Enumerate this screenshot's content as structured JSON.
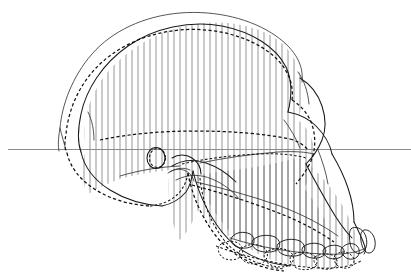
{
  "figure": {
    "background_color": "#ffffff",
    "width": 411,
    "height": 278,
    "view": "lateral (left side), anterior to the right"
  },
  "legend_semantics": {
    "solid_outline_label": "Solid outline skull profile",
    "dashed_outline_label": "Dashed outline skull profile",
    "hatched_region_label": "Vertically hatched shared cranial region",
    "reference_line_label": "Frankfurt horizontal reference line"
  },
  "colors": {
    "solid_stroke": "#1a1a1a",
    "dashed_stroke": "#111111",
    "hatch_stroke": "#555555",
    "reference_line": "#8c8c8c",
    "background": "#ffffff"
  },
  "reference_line": {
    "y": 149.5,
    "x_start": 8,
    "x_end": 411,
    "orientation": "horizontal"
  },
  "hatching": {
    "orientation": "vertical",
    "spacing_px": 6,
    "x_start": 58,
    "x_end": 352,
    "stroke_width": 0.62
  },
  "anatomy": {
    "ear_opening": {
      "cx": 156,
      "cy": 158,
      "rx": 9,
      "ry": 10.5
    },
    "parts": [
      "neurocranium vault",
      "occipital region",
      "supraorbital torus",
      "nasal aperture",
      "zygomatic arch",
      "maxilla",
      "mandible corpus",
      "upper tooth row",
      "lower tooth row"
    ]
  },
  "paths": {
    "solid_cranium": "M 298 116 C 300 100 302 84 297 70 C 290 47 268 27 234 16 C 198 5 152 11 120 29 C 90 46 68 74 60 104 C 53 130 54 142 58 150",
    "dashed_cranium": "M 291 121 C 295 104 296 86 291 72 C 283 50 260 32 229 23 C 196 14 156 21 128 38 C 100 55 80 82 73 108 C 67 131 67 143 70 151",
    "solid_vault_inner": "M 285 113 C 288 98 289 84 284 71 C 276 51 255 36 226 28 C 195 20 159 27 133 43 C 107 60 89 85 83 110 C 78 131 78 142 81 151",
    "occipital_solid": "M 58 150 C 62 162 74 176 92 187 C 112 199 134 204 152 205",
    "occipital_dashed": "M 70 151 C 74 163 86 175 102 184 C 120 194 140 198 156 199",
    "basicranium": "M 152 205 C 166 203 176 197 183 188 C 188 181 191 173 193 167",
    "zygomatic_solid": "M 166 166 C 176 162 186 162 196 166 C 206 170 214 176 219 182",
    "temporal_line_dashed": "M 104 138 C 130 133 162 130 196 130 C 232 130 266 133 288 137",
    "face_profile_solid": "M 298 116 C 310 118 322 122 330 130 C 338 138 342 148 342 158 C 342 170 338 182 330 192 C 322 202 310 210 298 215",
    "nasal_dashed": "M 291 121 C 300 124 308 130 313 138 C 318 146 320 155 318 164 C 316 175 310 185 302 193",
    "maxilla_front": "M 342 158 C 348 168 354 180 358 192 C 362 204 364 216 364 226",
    "palate_dashed": "M 196 180 C 222 184 252 190 280 198 C 306 206 326 214 340 222",
    "mandible_solid": "M 193 167 C 200 186 210 206 224 222 C 240 240 262 252 286 258",
    "mandible_dashed": "M 186 176 C 190 196 198 216 210 232 C 224 250 244 260 266 264",
    "upper_toothrow": "M 232 238 C 258 246 288 252 318 254 C 336 255 350 254 360 250",
    "lower_toothrow_dashed": "M 222 248 C 250 258 282 265 314 267 C 334 268 350 266 360 260"
  },
  "teeth": {
    "upper_row_count": 8,
    "lower_row_count": 8,
    "incisor_count": 2
  }
}
